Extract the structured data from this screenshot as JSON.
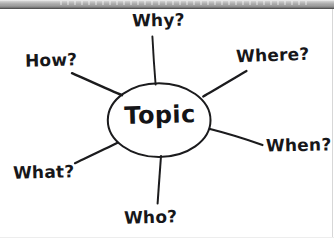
{
  "document": {
    "type": "spider-diagram",
    "background_color": "#ffffff",
    "ink_color": "#1a1a1d",
    "scan_bar_color": "#9a9a9a"
  },
  "diagram": {
    "center": {
      "label": "Topic",
      "shape": "ellipse",
      "cx": 159,
      "cy": 120,
      "rx": 51,
      "ry": 37
    },
    "spokes": [
      {
        "label": "Why?",
        "direction": "top",
        "x1": 155,
        "y1": 84,
        "x2": 152,
        "y2": 36
      },
      {
        "label": "Where?",
        "direction": "upper-right",
        "x1": 203,
        "y1": 96,
        "x2": 246,
        "y2": 71
      },
      {
        "label": "When?",
        "direction": "right",
        "x1": 210,
        "y1": 129,
        "x2": 262,
        "y2": 145
      },
      {
        "label": "Who?",
        "direction": "bottom",
        "x1": 161,
        "y1": 156,
        "x2": 157,
        "y2": 203
      },
      {
        "label": "What?",
        "direction": "lower-left",
        "x1": 117,
        "y1": 143,
        "x2": 75,
        "y2": 163
      },
      {
        "label": "How?",
        "direction": "upper-left",
        "x1": 122,
        "y1": 95,
        "x2": 72,
        "y2": 73
      }
    ],
    "labels": {
      "why": "Why?",
      "where": "Where?",
      "how": "How?",
      "when": "When?",
      "what": "What?",
      "who": "Who?",
      "topic": "Topic"
    }
  }
}
